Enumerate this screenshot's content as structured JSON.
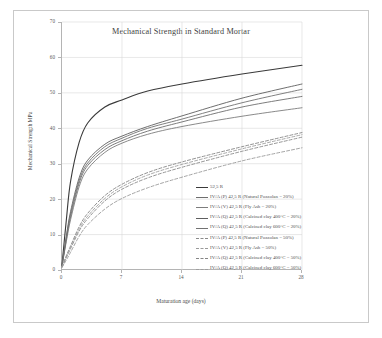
{
  "figure": {
    "background": "#ffffff",
    "frame_color": "#c9c9c9"
  },
  "chart_data": {
    "type": "line",
    "title": "Mechanical Strength in Standard Mortar",
    "xlabel": "Maturation age (days)",
    "ylabel": "Mechanical Strength MPa",
    "xlim": [
      0,
      28
    ],
    "ylim": [
      0,
      70
    ],
    "xticks": [
      0,
      7,
      14,
      21,
      28
    ],
    "yticks": [
      0,
      10,
      20,
      30,
      40,
      50,
      60,
      70
    ],
    "xtick_labels": [
      "0",
      "7",
      "14",
      "21",
      "28"
    ],
    "ytick_labels": [
      "0",
      "10",
      "20",
      "30",
      "40",
      "50",
      "60",
      "70"
    ],
    "grid": true,
    "grid_color": "#d8d8d8",
    "legend_position": "inside-lower-right",
    "x": [
      0,
      0.5,
      1,
      2,
      3,
      5,
      7,
      10,
      14,
      21,
      28
    ],
    "series": [
      {
        "name": "52,5 R",
        "label": "52,5 R",
        "style": "solid",
        "color": "#3a3a3a",
        "width": 1.1,
        "values": [
          1.5,
          14.0,
          25.0,
          36.0,
          41.5,
          46.0,
          48.0,
          50.5,
          52.5,
          55.3,
          57.8
        ]
      },
      {
        "name": "IV/A (P) 42,5 R (Natural Pozzolan = 20%)",
        "label": "IV/A (P) 42,5 R  (Natural Pozzolan = 20%)",
        "style": "solid",
        "color": "#6e6e6e",
        "width": 0.9,
        "values": [
          1.2,
          8.5,
          15.0,
          24.5,
          29.5,
          34.0,
          36.5,
          39.2,
          41.8,
          46.0,
          49.0
        ]
      },
      {
        "name": "IV/A (V) 42,5 R (Fly Ash = 20%)",
        "label": "IV/A (V) 42,5 R  (Fly Ash = 20%)",
        "style": "solid",
        "color": "#7d7d7d",
        "width": 0.9,
        "values": [
          1.1,
          8.0,
          14.2,
          23.5,
          28.5,
          33.2,
          35.8,
          38.3,
          40.5,
          43.4,
          45.8
        ]
      },
      {
        "name": "IV/A (Q) 42,5 R (Calcined clay 400C = 20%)",
        "label": "IV/A (Q) 42,5 R  (Calcined clay 400°C = 20%)",
        "style": "solid",
        "color": "#5f5f5f",
        "width": 0.9,
        "values": [
          1.3,
          9.5,
          16.5,
          26.0,
          31.0,
          35.5,
          37.8,
          40.5,
          43.5,
          48.5,
          52.5
        ]
      },
      {
        "name": "IV/A (Q) 42,5 R (Calcined clay 600C = 20%)",
        "label": "IV/A (Q) 42,5 R  (Calcined clay 600°C = 20%)",
        "style": "solid",
        "color": "#727272",
        "width": 0.9,
        "values": [
          1.2,
          9.0,
          15.8,
          25.2,
          30.2,
          34.8,
          37.2,
          40.0,
          42.6,
          47.2,
          51.0
        ]
      },
      {
        "name": "IV/A (P) 42,5 R (Natural Pozzolan = 50%)",
        "label": "IV/A (P) 42,5 R  (Natural Pozzolan = 50%)",
        "style": "dashed",
        "color": "#8a8a8a",
        "width": 0.9,
        "values": [
          0.8,
          3.5,
          6.0,
          11.0,
          14.5,
          19.5,
          22.8,
          26.0,
          29.0,
          33.5,
          37.5
        ]
      },
      {
        "name": "IV/A (V) 42,5 R (Fly Ash = 50%)",
        "label": "IV/A (V) 42,5 R  (Fly Ash = 50%)",
        "style": "dashed",
        "color": "#9a9a9a",
        "width": 0.9,
        "values": [
          0.7,
          2.8,
          5.0,
          9.5,
          12.8,
          17.2,
          20.2,
          23.2,
          26.2,
          30.8,
          34.5
        ]
      },
      {
        "name": "IV/A (Q) 42,5 R (Calcined clay 400C = 50%)",
        "label": "IV/A (Q) 42,5 R  (Calcined clay 400°C = 50%)",
        "style": "dashed",
        "color": "#858585",
        "width": 0.9,
        "values": [
          0.9,
          4.0,
          6.8,
          12.2,
          16.0,
          21.0,
          24.2,
          27.5,
          30.5,
          34.8,
          38.8
        ]
      },
      {
        "name": "IV/A (Q) 42,5 R (Calcined clay 600C = 50%)",
        "label": "IV/A (Q) 42,5 R  (Calcined clay 600°C = 50%)",
        "style": "dashed",
        "color": "#9e9e9e",
        "width": 0.9,
        "values": [
          0.85,
          3.8,
          6.4,
          11.6,
          15.2,
          20.2,
          23.5,
          26.8,
          29.8,
          34.2,
          38.2
        ]
      }
    ]
  }
}
